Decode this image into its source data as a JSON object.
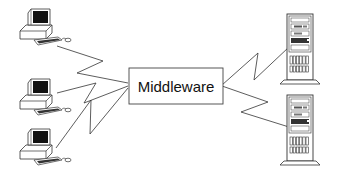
{
  "diagram": {
    "middleware": {
      "label": "Middleware"
    },
    "clients": [
      {
        "type": "desktop-computer"
      },
      {
        "type": "desktop-computer"
      },
      {
        "type": "desktop-computer"
      }
    ],
    "servers": [
      {
        "type": "tower-server"
      },
      {
        "type": "tower-server"
      }
    ],
    "connections": [
      {
        "from": "client-1",
        "to": "middleware",
        "style": "lightning"
      },
      {
        "from": "client-2",
        "to": "middleware",
        "style": "lightning"
      },
      {
        "from": "client-3",
        "to": "middleware",
        "style": "lightning"
      },
      {
        "from": "middleware",
        "to": "server-1",
        "style": "lightning"
      },
      {
        "from": "middleware",
        "to": "server-2",
        "style": "lightning"
      }
    ],
    "colors": {
      "line": "#333333",
      "fill": "#ffffff",
      "screen": "#111111"
    }
  }
}
